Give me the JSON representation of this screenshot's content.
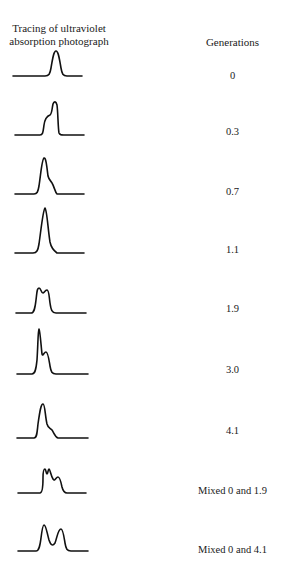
{
  "figure": {
    "left_header_line1": "Tracing of ultraviolet",
    "left_header_line2": "absorption photograph",
    "right_header": "Generations",
    "rows": [
      {
        "generations": "0"
      },
      {
        "generations": "0.3"
      },
      {
        "generations": "0.7"
      },
      {
        "generations": "1.1"
      },
      {
        "generations": "1.9"
      },
      {
        "generations": "3.0"
      },
      {
        "generations": "4.1"
      },
      {
        "generations": "Mixed 0 and 1.9"
      },
      {
        "generations": "Mixed 0 and 4.1"
      }
    ],
    "line_color": "#111111",
    "background": "#ffffff"
  }
}
